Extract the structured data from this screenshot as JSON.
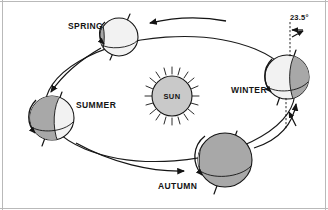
{
  "diagram": {
    "center_body": {
      "name": "sun",
      "label": "SUN",
      "fill_color": "#c9c9c9",
      "ray_count": 18
    },
    "tilt_annotation": {
      "label": "23.5°",
      "description": "axial tilt angle"
    },
    "orbit": {
      "direction": "counter-clockwise",
      "stroke_color": "#1a1a1a"
    },
    "colors": {
      "lit_side": "#f2f2f2",
      "dark_side": "#a8a8a8",
      "outline": "#141414",
      "background": "#ffffff",
      "frame": "#b9b9b9"
    },
    "positions": [
      {
        "id": "spring",
        "label": "SPRING",
        "label_x": 68,
        "label_y": 29,
        "globe_cx": 119,
        "globe_cy": 37,
        "globe_r": 19,
        "dark_fraction": 0.16,
        "dark_side": "left"
      },
      {
        "id": "summer",
        "label": "SUMMER",
        "label_x": 76,
        "label_y": 108,
        "globe_cx": 52,
        "globe_cy": 118,
        "globe_r": 22,
        "dark_fraction": 0.5,
        "dark_side": "left"
      },
      {
        "id": "autumn",
        "label": "AUTUMN",
        "label_x": 158,
        "label_y": 189,
        "globe_cx": 225,
        "globe_cy": 160,
        "globe_r": 27,
        "dark_fraction": 0.88,
        "dark_side": "left"
      },
      {
        "id": "winter",
        "label": "WINTER",
        "label_x": 231,
        "label_y": 93,
        "globe_cx": 287,
        "globe_cy": 77,
        "globe_r": 22,
        "dark_fraction": 0.45,
        "dark_side": "right"
      }
    ]
  }
}
